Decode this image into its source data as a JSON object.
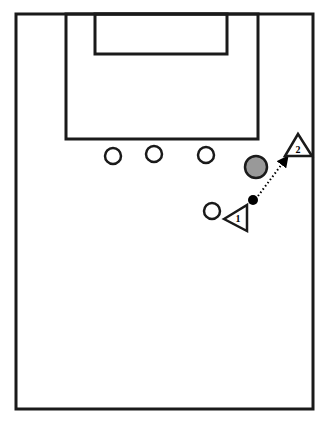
{
  "diagram": {
    "type": "basketball-half-court-play",
    "court": {
      "x": 16,
      "y": 14,
      "w": 297,
      "h": 395,
      "stroke": "#1a1a1a"
    },
    "lane": {
      "x": 66,
      "y": 14,
      "w": 192,
      "h": 125
    },
    "inner_box": {
      "x": 95,
      "y": 14,
      "w": 132,
      "h": 40
    },
    "defenders": [
      {
        "cx": 113,
        "cy": 156,
        "r": 8
      },
      {
        "cx": 154,
        "cy": 154,
        "r": 8
      },
      {
        "cx": 206,
        "cy": 155,
        "r": 8
      },
      {
        "cx": 212,
        "cy": 211,
        "r": 8
      }
    ],
    "ball_shaded": {
      "cx": 256,
      "cy": 167,
      "r": 11,
      "fill": "#999999"
    },
    "ball_holder_dot": {
      "cx": 253,
      "cy": 200,
      "r": 5,
      "fill": "#000000"
    },
    "players": [
      {
        "label": "1",
        "points": "224,219 247,205 247,231",
        "tx": 238,
        "ty": 222
      },
      {
        "label": "2",
        "points": "298,134 285,156 312,156",
        "tx": 298,
        "ty": 153
      }
    ],
    "pass": {
      "x1": 258,
      "y1": 196,
      "x2": 285,
      "y2": 160,
      "style": "dotted",
      "arrow": true
    }
  }
}
